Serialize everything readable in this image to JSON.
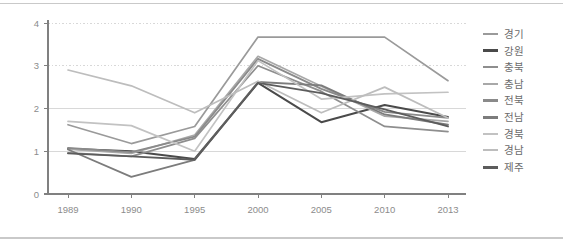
{
  "chart_data": {
    "type": "line",
    "title": "",
    "xlabel": "",
    "ylabel": "",
    "categories": [
      "1989",
      "1990",
      "1995",
      "2000",
      "2005",
      "2010",
      "2013"
    ],
    "x_tick_labels": [
      "1989",
      "1990",
      "1995",
      "2000",
      "2005",
      "2010",
      "2013"
    ],
    "y_tick_labels": [
      "0",
      "1",
      "2",
      "3",
      "4"
    ],
    "y_ticks": [
      0,
      1,
      2,
      3,
      4
    ],
    "ylim": [
      0,
      4
    ],
    "grid": "horizontal-dotted",
    "legend_position": "right",
    "series": [
      {
        "name": "경기",
        "color": "#9a9a9a",
        "width": 1.7,
        "values": [
          1.62,
          1.18,
          1.58,
          3.67,
          3.67,
          3.67,
          2.65
        ]
      },
      {
        "name": "강원",
        "color": "#4a4a4a",
        "width": 2.0,
        "values": [
          1.06,
          1.0,
          0.82,
          2.6,
          1.68,
          2.08,
          1.8
        ]
      },
      {
        "name": "충북",
        "color": "#8e8e8e",
        "width": 1.7,
        "values": [
          0.96,
          0.88,
          1.3,
          3.0,
          2.4,
          1.58,
          1.46
        ]
      },
      {
        "name": "충남",
        "color": "#a8a8a8",
        "width": 1.7,
        "values": [
          1.05,
          0.95,
          1.38,
          3.22,
          2.52,
          1.82,
          1.7
        ]
      },
      {
        "name": "전북",
        "color": "#8a8a8a",
        "width": 1.8,
        "values": [
          1.08,
          0.98,
          1.34,
          3.16,
          2.46,
          1.92,
          1.78
        ]
      },
      {
        "name": "전남",
        "color": "#7c7c7c",
        "width": 1.8,
        "values": [
          1.04,
          0.4,
          0.8,
          2.62,
          2.54,
          1.86,
          1.62
        ]
      },
      {
        "name": "경북",
        "color": "#c2c2c2",
        "width": 1.7,
        "values": [
          1.7,
          1.6,
          1.0,
          3.12,
          2.22,
          2.34,
          2.38
        ]
      },
      {
        "name": "경남",
        "color": "#bdbdbd",
        "width": 1.7,
        "values": [
          2.9,
          2.53,
          1.9,
          2.64,
          1.9,
          2.5,
          1.78
        ]
      },
      {
        "name": "제주",
        "color": "#5c5c5c",
        "width": 1.9,
        "values": [
          0.95,
          0.88,
          0.8,
          2.6,
          2.36,
          1.98,
          1.58
        ]
      }
    ],
    "colors": {
      "axis": "#808080",
      "gridline": "#d8d8d8",
      "tick_text": "#8c8c8c",
      "legend_text": "#6b6b6b",
      "background": "#ffffff",
      "frame": "#c9c9c9"
    }
  },
  "legend": {
    "items": [
      {
        "label": "경기"
      },
      {
        "label": "강원"
      },
      {
        "label": "충북"
      },
      {
        "label": "충남"
      },
      {
        "label": "전북"
      },
      {
        "label": "전남"
      },
      {
        "label": "경북"
      },
      {
        "label": "경남"
      },
      {
        "label": "제주"
      }
    ]
  }
}
